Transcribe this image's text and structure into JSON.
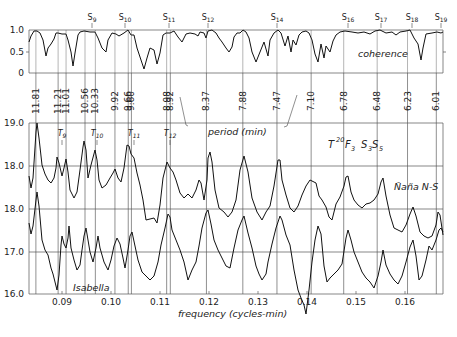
{
  "chart_data": {
    "type": "line",
    "title": "",
    "xlabel": "frequency (cycles-min)",
    "x_ticks": [
      "0.09",
      "0.10",
      "0.11",
      "0.12",
      "0.13",
      "0.14",
      "0.15",
      "0.16"
    ],
    "x_range": [
      0.084,
      0.166
    ],
    "top_axis_label": "period (min)",
    "period_labels": [
      "11.81",
      "11.21",
      "11.01",
      "10.56",
      "10.33",
      "9.92",
      "9.66",
      "9.60",
      "8.98",
      "8.92",
      "8.37",
      "7.88",
      "7.47",
      "7.10",
      "6.78",
      "6.48",
      "6.23",
      "6.01"
    ],
    "seiche_labels": [
      "S9",
      "S10",
      "S11",
      "S12",
      "S14",
      "S16",
      "S17",
      "S18",
      "S19"
    ],
    "tide_labels": [
      "T9",
      "T10",
      "T11",
      "T12"
    ],
    "panels": [
      {
        "name": "coherence",
        "label": "coherence",
        "y_ticks": [
          "1.0",
          "0.5",
          "0"
        ],
        "ylim": [
          0,
          1.0
        ],
        "series_description": "coherence between stations, mostly near 1.0 with dips"
      },
      {
        "name": "nana",
        "label": "Ñaña N-S",
        "annotation": "T20F3 S3S5",
        "y_ticks": [
          "19.0",
          "18.0"
        ],
        "ylim": [
          17.0,
          19.0
        ],
        "peaks_freq": [
          0.0847,
          0.0885,
          0.0905,
          0.094,
          0.0965,
          0.101,
          0.1035,
          0.1115,
          0.1195,
          0.127,
          0.1345,
          0.1415,
          0.1475,
          0.1545
        ]
      },
      {
        "name": "isabella",
        "label": "Isabella",
        "y_ticks": [
          "18.0",
          "17.0",
          "16.0"
        ],
        "ylim": [
          16.0,
          18.0
        ],
        "peaks_freq": [
          0.0847,
          0.0885,
          0.0905,
          0.094,
          0.0965,
          0.101,
          0.1035,
          0.1115,
          0.1195,
          0.127,
          0.1345,
          0.1415,
          0.1475,
          0.1545,
          0.1605,
          0.165
        ]
      }
    ],
    "grid": true
  },
  "labels": {
    "coherence": "coherence",
    "period": "period (min)",
    "frequency": "frequency (cycles-min)",
    "nana": "Ñaña N-S",
    "isabella": "Isabella"
  }
}
